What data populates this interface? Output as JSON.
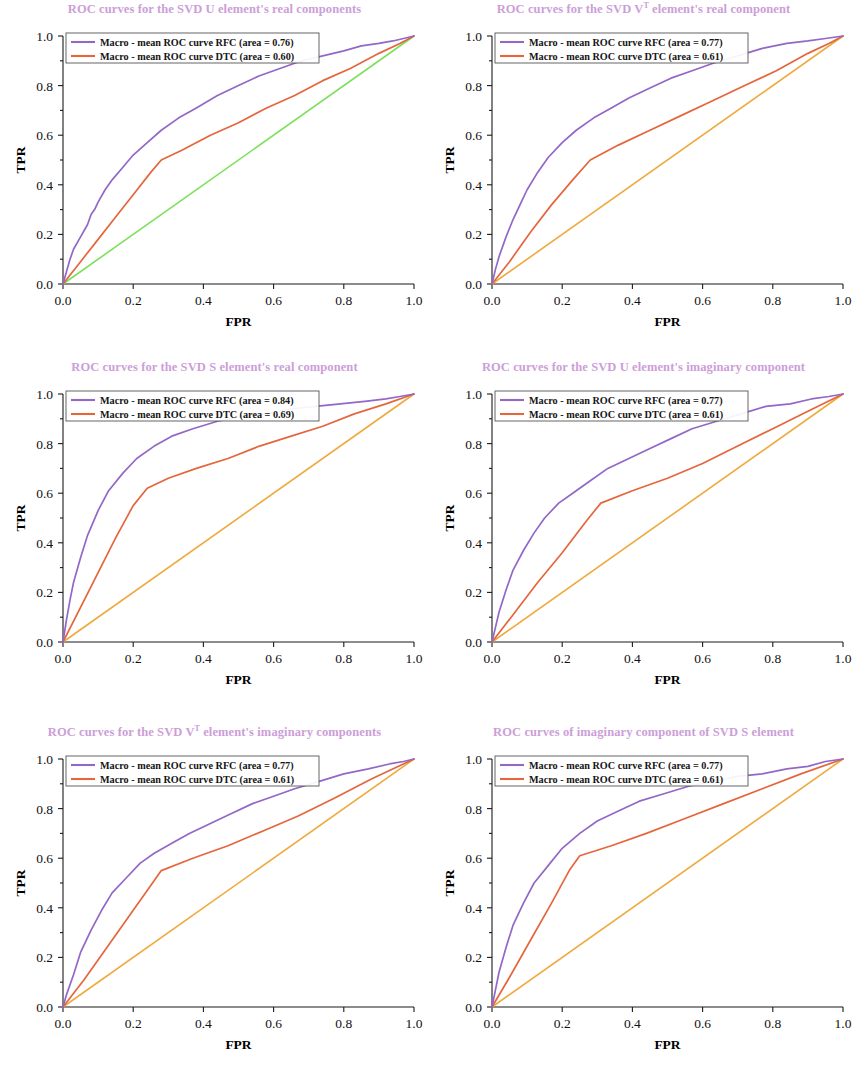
{
  "figure": {
    "colors": {
      "title": "#cc9ed9",
      "rfc": "#9367c7",
      "dtc": "#e4663c",
      "diagonal_green": "#7ce05a",
      "diagonal_orange": "#f0a93c",
      "axis": "#1a1a1a",
      "text": "#111111"
    },
    "axis": {
      "xlabel": "FPR",
      "ylabel": "TPR",
      "xticks": [
        "0.0",
        "0.2",
        "0.4",
        "0.6",
        "0.8",
        "1.0"
      ],
      "yticks": [
        "0.0",
        "0.2",
        "0.4",
        "0.6",
        "0.8",
        "1.0"
      ]
    }
  },
  "chart_data": [
    {
      "type": "line",
      "id": "svd-u-real",
      "title_pre": "ROC curves for the SVD U element's real components",
      "title_parts": {
        "before": "ROC curves for the SVD U element's real components",
        "sup": "",
        "after": ""
      },
      "xlabel": "FPR",
      "ylabel": "TPR",
      "xlim": [
        0.0,
        1.0
      ],
      "ylim": [
        0.0,
        1.0
      ],
      "grid": false,
      "legend_position": "upper-left",
      "diagonal_color": "#7ce05a",
      "legend": [
        "Macro - mean ROC curve RFC (area = 0.76)",
        "Macro - mean ROC curve DTC (area = 0.60)"
      ],
      "series": [
        {
          "name": "Macro - mean ROC curve RFC (area = 0.76)",
          "area": 0.76,
          "color": "#9367c7",
          "x": [
            0.0,
            0.01,
            0.02,
            0.03,
            0.05,
            0.07,
            0.08,
            0.09,
            0.1,
            0.12,
            0.14,
            0.17,
            0.2,
            0.24,
            0.28,
            0.33,
            0.38,
            0.44,
            0.5,
            0.56,
            0.62,
            0.68,
            0.74,
            0.8,
            0.85,
            0.9,
            0.94,
            0.97,
            1.0
          ],
          "y": [
            0.0,
            0.05,
            0.1,
            0.14,
            0.19,
            0.24,
            0.28,
            0.3,
            0.33,
            0.38,
            0.42,
            0.47,
            0.52,
            0.57,
            0.62,
            0.67,
            0.71,
            0.76,
            0.8,
            0.84,
            0.87,
            0.9,
            0.92,
            0.94,
            0.96,
            0.97,
            0.98,
            0.99,
            1.0
          ]
        },
        {
          "name": "Macro - mean ROC curve DTC (area = 0.60)",
          "area": 0.6,
          "color": "#e4663c",
          "x": [
            0.0,
            0.05,
            0.1,
            0.15,
            0.2,
            0.25,
            0.28,
            0.34,
            0.42,
            0.5,
            0.58,
            0.66,
            0.74,
            0.82,
            0.9,
            0.96,
            1.0
          ],
          "y": [
            0.0,
            0.09,
            0.18,
            0.27,
            0.36,
            0.45,
            0.5,
            0.54,
            0.6,
            0.65,
            0.71,
            0.76,
            0.82,
            0.87,
            0.93,
            0.97,
            1.0
          ]
        },
        {
          "name": "chance",
          "color": "#7ce05a",
          "x": [
            0.0,
            1.0
          ],
          "y": [
            0.0,
            1.0
          ]
        }
      ]
    },
    {
      "type": "line",
      "id": "svd-vt-real",
      "title_parts": {
        "before": "ROC curves for the SVD V",
        "sup": "T",
        "after": " element's real component"
      },
      "xlabel": "FPR",
      "ylabel": "TPR",
      "xlim": [
        0.0,
        1.0
      ],
      "ylim": [
        0.0,
        1.0
      ],
      "grid": false,
      "legend_position": "upper-left",
      "diagonal_color": "#f0a93c",
      "legend": [
        "Macro - mean ROC curve RFC (area = 0.77)",
        "Macro - mean ROC curve DTC (area = 0.61)"
      ],
      "series": [
        {
          "name": "Macro - mean ROC curve RFC (area = 0.77)",
          "area": 0.77,
          "color": "#9367c7",
          "x": [
            0.0,
            0.01,
            0.02,
            0.04,
            0.06,
            0.08,
            0.1,
            0.13,
            0.16,
            0.2,
            0.24,
            0.29,
            0.34,
            0.39,
            0.45,
            0.51,
            0.57,
            0.63,
            0.7,
            0.77,
            0.84,
            0.9,
            0.95,
            1.0
          ],
          "y": [
            0.0,
            0.06,
            0.11,
            0.19,
            0.26,
            0.32,
            0.38,
            0.45,
            0.51,
            0.57,
            0.62,
            0.67,
            0.71,
            0.75,
            0.79,
            0.83,
            0.86,
            0.89,
            0.92,
            0.95,
            0.97,
            0.98,
            0.99,
            1.0
          ]
        },
        {
          "name": "Macro - mean ROC curve DTC (area = 0.61)",
          "area": 0.61,
          "color": "#e4663c",
          "x": [
            0.0,
            0.05,
            0.11,
            0.17,
            0.23,
            0.28,
            0.36,
            0.45,
            0.54,
            0.63,
            0.72,
            0.81,
            0.9,
            0.96,
            1.0
          ],
          "y": [
            0.0,
            0.09,
            0.21,
            0.32,
            0.42,
            0.5,
            0.56,
            0.62,
            0.68,
            0.74,
            0.8,
            0.86,
            0.93,
            0.97,
            1.0
          ]
        },
        {
          "name": "chance",
          "color": "#f0a93c",
          "x": [
            0.0,
            1.0
          ],
          "y": [
            0.0,
            1.0
          ]
        }
      ]
    },
    {
      "type": "line",
      "id": "svd-s-real",
      "title_parts": {
        "before": "ROC curves for the SVD S element's real component",
        "sup": "",
        "after": ""
      },
      "xlabel": "FPR",
      "ylabel": "TPR",
      "xlim": [
        0.0,
        1.0
      ],
      "ylim": [
        0.0,
        1.0
      ],
      "grid": false,
      "legend_position": "upper-left",
      "diagonal_color": "#f0a93c",
      "legend": [
        "Macro - mean ROC curve RFC (area = 0.84)",
        "Macro - mean ROC curve DTC (area = 0.69)"
      ],
      "series": [
        {
          "name": "Macro - mean ROC curve RFC (area = 0.84)",
          "area": 0.84,
          "color": "#9367c7",
          "x": [
            0.0,
            0.01,
            0.02,
            0.03,
            0.05,
            0.07,
            0.1,
            0.13,
            0.17,
            0.21,
            0.26,
            0.31,
            0.37,
            0.44,
            0.51,
            0.58,
            0.65,
            0.72,
            0.79,
            0.86,
            0.92,
            0.96,
            1.0
          ],
          "y": [
            0.0,
            0.09,
            0.17,
            0.24,
            0.34,
            0.43,
            0.53,
            0.61,
            0.68,
            0.74,
            0.79,
            0.83,
            0.86,
            0.89,
            0.91,
            0.92,
            0.94,
            0.95,
            0.96,
            0.97,
            0.98,
            0.99,
            1.0
          ]
        },
        {
          "name": "Macro - mean ROC curve DTC (area = 0.69)",
          "area": 0.69,
          "color": "#e4663c",
          "x": [
            0.0,
            0.05,
            0.1,
            0.15,
            0.2,
            0.24,
            0.3,
            0.38,
            0.47,
            0.56,
            0.65,
            0.74,
            0.83,
            0.92,
            1.0
          ],
          "y": [
            0.0,
            0.14,
            0.28,
            0.42,
            0.55,
            0.62,
            0.66,
            0.7,
            0.74,
            0.79,
            0.83,
            0.87,
            0.92,
            0.96,
            1.0
          ]
        },
        {
          "name": "chance",
          "color": "#f0a93c",
          "x": [
            0.0,
            1.0
          ],
          "y": [
            0.0,
            1.0
          ]
        }
      ]
    },
    {
      "type": "line",
      "id": "svd-u-imag",
      "title_parts": {
        "before": "ROC curves for the SVD U element's imaginary component",
        "sup": "",
        "after": ""
      },
      "xlabel": "FPR",
      "ylabel": "TPR",
      "xlim": [
        0.0,
        1.0
      ],
      "ylim": [
        0.0,
        1.0
      ],
      "grid": false,
      "legend_position": "upper-left",
      "diagonal_color": "#f0a93c",
      "legend": [
        "Macro - mean ROC curve RFC (area = 0.77)",
        "Macro - mean ROC curve DTC (area = 0.61)"
      ],
      "series": [
        {
          "name": "Macro - mean ROC curve RFC (area = 0.77)",
          "area": 0.77,
          "color": "#9367c7",
          "x": [
            0.0,
            0.01,
            0.02,
            0.04,
            0.06,
            0.09,
            0.12,
            0.15,
            0.19,
            0.23,
            0.28,
            0.33,
            0.39,
            0.45,
            0.51,
            0.57,
            0.64,
            0.71,
            0.78,
            0.85,
            0.91,
            0.96,
            1.0
          ],
          "y": [
            0.0,
            0.06,
            0.12,
            0.21,
            0.29,
            0.37,
            0.44,
            0.5,
            0.56,
            0.6,
            0.65,
            0.7,
            0.74,
            0.78,
            0.82,
            0.86,
            0.89,
            0.92,
            0.95,
            0.96,
            0.98,
            0.99,
            1.0
          ]
        },
        {
          "name": "Macro - mean ROC curve DTC (area = 0.61)",
          "area": 0.61,
          "color": "#e4663c",
          "x": [
            0.0,
            0.06,
            0.13,
            0.2,
            0.27,
            0.31,
            0.4,
            0.5,
            0.6,
            0.7,
            0.8,
            0.9,
            1.0
          ],
          "y": [
            0.0,
            0.11,
            0.24,
            0.36,
            0.49,
            0.56,
            0.61,
            0.66,
            0.72,
            0.79,
            0.86,
            0.93,
            1.0
          ]
        },
        {
          "name": "chance",
          "color": "#f0a93c",
          "x": [
            0.0,
            1.0
          ],
          "y": [
            0.0,
            1.0
          ]
        }
      ]
    },
    {
      "type": "line",
      "id": "svd-vt-imag",
      "title_parts": {
        "before": "ROC curves for the SVD V",
        "sup": "T",
        "after": " element's imaginary components"
      },
      "xlabel": "FPR",
      "ylabel": "TPR",
      "xlim": [
        0.0,
        1.0
      ],
      "ylim": [
        0.0,
        1.0
      ],
      "grid": false,
      "legend_position": "upper-left",
      "diagonal_color": "#f0a93c",
      "legend": [
        "Macro - mean ROC curve RFC (area = 0.77)",
        "Macro - mean ROC curve DTC (area = 0.61)"
      ],
      "series": [
        {
          "name": "Macro - mean ROC curve RFC (area = 0.77)",
          "area": 0.77,
          "color": "#9367c7",
          "x": [
            0.0,
            0.01,
            0.03,
            0.05,
            0.08,
            0.11,
            0.14,
            0.18,
            0.22,
            0.26,
            0.31,
            0.36,
            0.42,
            0.48,
            0.54,
            0.6,
            0.66,
            0.73,
            0.8,
            0.87,
            0.93,
            0.97,
            1.0
          ],
          "y": [
            0.0,
            0.05,
            0.13,
            0.22,
            0.31,
            0.39,
            0.46,
            0.52,
            0.58,
            0.62,
            0.66,
            0.7,
            0.74,
            0.78,
            0.82,
            0.85,
            0.88,
            0.91,
            0.94,
            0.96,
            0.98,
            0.99,
            1.0
          ]
        },
        {
          "name": "Macro - mean ROC curve DTC (area = 0.61)",
          "area": 0.61,
          "color": "#e4663c",
          "x": [
            0.0,
            0.06,
            0.12,
            0.19,
            0.25,
            0.28,
            0.37,
            0.47,
            0.57,
            0.67,
            0.77,
            0.88,
            1.0
          ],
          "y": [
            0.0,
            0.11,
            0.23,
            0.37,
            0.49,
            0.55,
            0.6,
            0.65,
            0.71,
            0.77,
            0.84,
            0.92,
            1.0
          ]
        },
        {
          "name": "chance",
          "color": "#f0a93c",
          "x": [
            0.0,
            1.0
          ],
          "y": [
            0.0,
            1.0
          ]
        }
      ]
    },
    {
      "type": "line",
      "id": "svd-s-imag",
      "title_parts": {
        "before": "ROC curves of imaginary component of SVD S element",
        "sup": "",
        "after": ""
      },
      "xlabel": "FPR",
      "ylabel": "TPR",
      "xlim": [
        0.0,
        1.0
      ],
      "ylim": [
        0.0,
        1.0
      ],
      "grid": false,
      "legend_position": "upper-left",
      "diagonal_color": "#f0a93c",
      "legend": [
        "Macro - mean ROC curve RFC (area = 0.77)",
        "Macro - mean ROC curve DTC (area = 0.61)"
      ],
      "series": [
        {
          "name": "Macro - mean ROC curve RFC (area = 0.77)",
          "area": 0.77,
          "color": "#9367c7",
          "x": [
            0.0,
            0.01,
            0.02,
            0.04,
            0.06,
            0.09,
            0.12,
            0.16,
            0.2,
            0.25,
            0.3,
            0.36,
            0.42,
            0.49,
            0.56,
            0.63,
            0.7,
            0.77,
            0.84,
            0.9,
            0.95,
            1.0
          ],
          "y": [
            0.0,
            0.07,
            0.14,
            0.24,
            0.33,
            0.42,
            0.5,
            0.57,
            0.64,
            0.7,
            0.75,
            0.79,
            0.83,
            0.86,
            0.89,
            0.91,
            0.93,
            0.94,
            0.96,
            0.97,
            0.99,
            1.0
          ]
        },
        {
          "name": "Macro - mean ROC curve DTC (area = 0.61)",
          "area": 0.61,
          "color": "#e4663c",
          "x": [
            0.0,
            0.05,
            0.11,
            0.17,
            0.22,
            0.25,
            0.34,
            0.44,
            0.55,
            0.66,
            0.77,
            0.88,
            1.0
          ],
          "y": [
            0.0,
            0.12,
            0.27,
            0.42,
            0.55,
            0.61,
            0.65,
            0.7,
            0.76,
            0.82,
            0.88,
            0.94,
            1.0
          ]
        },
        {
          "name": "chance",
          "color": "#f0a93c",
          "x": [
            0.0,
            1.0
          ],
          "y": [
            0.0,
            1.0
          ]
        }
      ]
    }
  ]
}
